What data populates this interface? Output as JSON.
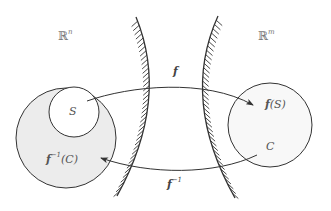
{
  "diagram": {
    "colors": {
      "stroke": "#333333",
      "domain_fill": "#ececec",
      "codomain_fill": "#f8f8f8",
      "background": "#ffffff"
    },
    "spaces": {
      "domain": {
        "base": "ℝ",
        "exp": "n"
      },
      "codomain": {
        "base": "ℝ",
        "exp": "m"
      }
    },
    "sets": {
      "S": "S",
      "preimage": {
        "fn": "f",
        "exp": "−1",
        "arg": "(C)"
      },
      "image": {
        "fn": "f",
        "arg": "(S)"
      },
      "C": "C"
    },
    "maps": {
      "forward": {
        "fn": "f"
      },
      "inverse": {
        "fn": "f",
        "exp": "−1"
      }
    }
  }
}
